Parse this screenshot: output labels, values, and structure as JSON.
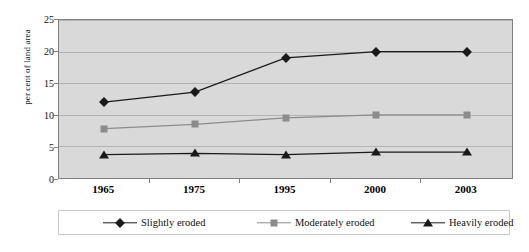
{
  "chart_data": {
    "type": "line",
    "title": "",
    "xlabel": "",
    "ylabel": "per cent of land area",
    "categories": [
      "1965",
      "1975",
      "1995",
      "2000",
      "2003"
    ],
    "ylim": [
      0,
      25
    ],
    "ytick_values": [
      "25",
      "20",
      "15",
      "10",
      "5",
      "0"
    ],
    "grid": true,
    "legend_position": "bottom",
    "series": [
      {
        "name": "Slightly eroded",
        "marker": "diamond",
        "color": "#1a1a1a",
        "values": [
          12.0,
          13.6,
          19.0,
          20.0,
          20.0
        ]
      },
      {
        "name": "Moderately eroded",
        "marker": "square",
        "color": "#8c8c8c",
        "values": [
          7.8,
          8.5,
          9.5,
          10.0,
          10.0
        ]
      },
      {
        "name": "Heavily eroded",
        "marker": "triangle",
        "color": "#1a1a1a",
        "values": [
          3.7,
          3.9,
          3.7,
          4.1,
          4.1
        ]
      }
    ]
  },
  "axis": {
    "y_label": "per cent of land area",
    "y_ticks": [
      "25",
      "20",
      "15",
      "10",
      "5",
      "0"
    ],
    "x_ticks": [
      "1965",
      "1975",
      "1995",
      "2000",
      "2003"
    ]
  },
  "legend": {
    "items": [
      {
        "label": "Slightly eroded"
      },
      {
        "label": "Moderately eroded"
      },
      {
        "label": "Heavily eroded"
      }
    ]
  },
  "caption": {
    "text": ""
  },
  "colors": {
    "plot_background": "#d9d9d9",
    "gridline": "#b3b3b3",
    "axis": "#808080",
    "series_dark": "#1a1a1a",
    "series_gray": "#8c8c8c"
  }
}
